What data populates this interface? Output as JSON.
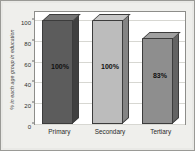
{
  "chart_data": {
    "type": "bar",
    "title": "",
    "subtitle": "",
    "xlabel": "",
    "ylabel": "% in each age group in education",
    "categories": [
      "Primary",
      "Secondary",
      "Tertiary"
    ],
    "values": [
      100,
      100,
      83
    ],
    "data_labels": [
      "100%",
      "100%",
      "83%"
    ],
    "ylim": [
      0,
      100
    ],
    "y_ticks": [
      0,
      20,
      40,
      60,
      80,
      100
    ],
    "y_tick_labels": [
      "0",
      "20",
      "40",
      "60",
      "80",
      "100"
    ],
    "grid": true,
    "legend": false,
    "legend_position": "none",
    "style": "3d-column",
    "series_colors": [
      "#5c5c5c",
      "#bcbcbc",
      "#8e8e8e"
    ],
    "plot_background": "#ffffff",
    "frame_background": "#eeeeeb",
    "border_color": "#8d8d8a"
  }
}
